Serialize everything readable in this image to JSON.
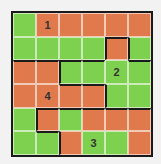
{
  "puzzle": {
    "rows": 6,
    "cols": 6,
    "colors": [
      "GOOOOO",
      "GGGGOG",
      "OOGGGG",
      "OOOOGG",
      "GOGOOO",
      "GGOGGO"
    ],
    "regions": [
      "111111",
      "111121",
      "442222",
      "444422",
      "433333",
      "443333"
    ],
    "labels": [
      {
        "r": 0,
        "c": 1,
        "text": "1"
      },
      {
        "r": 2,
        "c": 4,
        "text": "2"
      },
      {
        "r": 5,
        "c": 3,
        "text": "3"
      },
      {
        "r": 3,
        "c": 1,
        "text": "4"
      }
    ],
    "colors_hex": {
      "G": "#7ed04f",
      "O": "#e07a4d"
    }
  }
}
